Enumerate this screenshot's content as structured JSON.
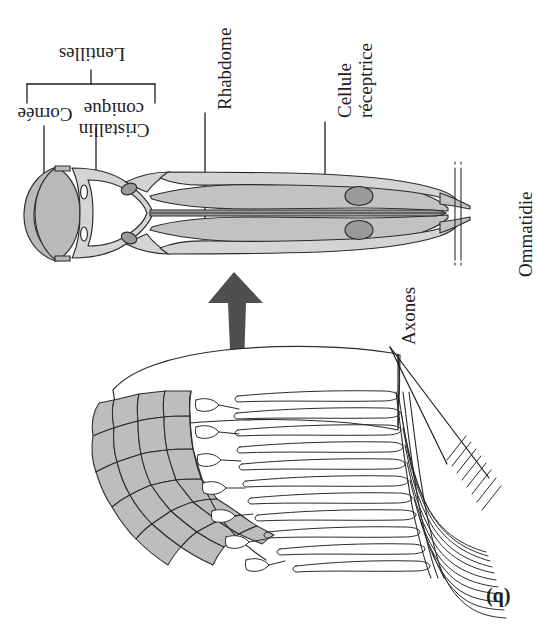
{
  "figure": {
    "panel_label": "(b)",
    "caption_language": "fr",
    "orientation_note": "entire figure rendered upside-down (rotated 180 degrees)"
  },
  "labels": {
    "lentilles": "Lentilles",
    "cornee": "Cornée",
    "cristallin_line1": "Cristallin",
    "cristallin_line2": "conique",
    "rhabdome": "Rhabdome",
    "cellule_line1": "Cellule",
    "cellule_line2": "réceptrice",
    "ommatidie": "Ommatidie",
    "axones": "Axones"
  },
  "colors": {
    "ink": "#1d1d1d",
    "stroke": "#2b2b2b",
    "tissue_fill": "#b9b9b9",
    "tissue_fill_light": "#c9c9c9",
    "nucleus_fill": "#9a9a9a",
    "facet_fill": "#bdbdbd",
    "arrow_fill": "#4f4f4f",
    "background": "#ffffff"
  },
  "diagram": {
    "upper_panel": "longitudinal section of a single ommatidium",
    "lower_panel": "cut-away block of the compound eye showing facets and axon bundle",
    "arrow": "thick tapered arrow pointing from the eye block up to the ommatidium section"
  }
}
